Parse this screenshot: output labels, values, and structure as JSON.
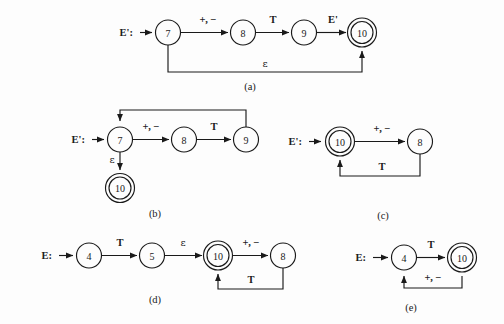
{
  "figure": {
    "background_color": "#fdfdfd",
    "stroke_color": "#1a1a1a",
    "panels": [
      {
        "id": "a",
        "caption": "(a)",
        "start_label": "E':",
        "states": [
          {
            "name": "7",
            "accepting": false
          },
          {
            "name": "8",
            "accepting": false
          },
          {
            "name": "9",
            "accepting": false
          },
          {
            "name": "10",
            "accepting": true
          }
        ],
        "transitions": [
          {
            "from": "7",
            "to": "8",
            "label": "+, −"
          },
          {
            "from": "8",
            "to": "9",
            "label": "T"
          },
          {
            "from": "9",
            "to": "10",
            "label": "E'"
          },
          {
            "from": "7",
            "to": "10",
            "label": "ε"
          }
        ]
      },
      {
        "id": "b",
        "caption": "(b)",
        "start_label": "E':",
        "states": [
          {
            "name": "7",
            "accepting": false
          },
          {
            "name": "8",
            "accepting": false
          },
          {
            "name": "9",
            "accepting": false
          },
          {
            "name": "10",
            "accepting": true
          }
        ],
        "transitions": [
          {
            "from": "7",
            "to": "8",
            "label": "+, −"
          },
          {
            "from": "8",
            "to": "9",
            "label": "T"
          },
          {
            "from": "9",
            "to": "7",
            "label": ""
          },
          {
            "from": "7",
            "to": "10",
            "label": "ε"
          }
        ]
      },
      {
        "id": "c",
        "caption": "(c)",
        "start_label": "E':",
        "states": [
          {
            "name": "10",
            "accepting": true
          },
          {
            "name": "8",
            "accepting": false
          }
        ],
        "transitions": [
          {
            "from": "10",
            "to": "8",
            "label": "+, −"
          },
          {
            "from": "8",
            "to": "10",
            "label": "T"
          }
        ]
      },
      {
        "id": "d",
        "caption": "(d)",
        "start_label": "E:",
        "states": [
          {
            "name": "4",
            "accepting": false
          },
          {
            "name": "5",
            "accepting": false
          },
          {
            "name": "10",
            "accepting": true
          },
          {
            "name": "8",
            "accepting": false
          }
        ],
        "transitions": [
          {
            "from": "4",
            "to": "5",
            "label": "T"
          },
          {
            "from": "5",
            "to": "10",
            "label": "ε"
          },
          {
            "from": "10",
            "to": "8",
            "label": "+, −"
          },
          {
            "from": "8",
            "to": "10",
            "label": "T"
          }
        ]
      },
      {
        "id": "e",
        "caption": "(e)",
        "start_label": "E:",
        "states": [
          {
            "name": "4",
            "accepting": false
          },
          {
            "name": "10",
            "accepting": true
          }
        ],
        "transitions": [
          {
            "from": "4",
            "to": "10",
            "label": "T"
          },
          {
            "from": "10",
            "to": "4",
            "label": "+, −"
          }
        ]
      }
    ]
  }
}
